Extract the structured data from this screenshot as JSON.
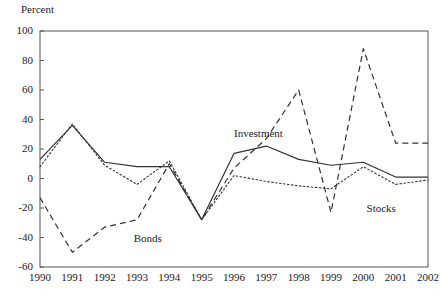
{
  "chart_data": {
    "type": "line",
    "title": "",
    "subtitle": "",
    "xlabel": "",
    "ylabel": "Percent",
    "categories": [
      "1990",
      "1991",
      "1992",
      "1993",
      "1994",
      "1995",
      "1996",
      "1997",
      "1998",
      "1999",
      "2000",
      "2001",
      "2002"
    ],
    "x": [
      1990,
      1991,
      1992,
      1993,
      1994,
      1995,
      1996,
      1997,
      1998,
      1999,
      2000,
      2001,
      2002
    ],
    "xlim": [
      1990,
      2002
    ],
    "ylim": [
      -60,
      100
    ],
    "yticks": [
      -60,
      -40,
      -20,
      0,
      20,
      40,
      60,
      80,
      100
    ],
    "ytick_labels": [
      "-60",
      "-40",
      "-20",
      "0",
      "20",
      "40",
      "60",
      "80",
      "100"
    ],
    "grid": false,
    "legend_position": "inline-annotations",
    "series": [
      {
        "name": "Investment",
        "style": "solid",
        "color": "#333333",
        "values": [
          13,
          36,
          11,
          8,
          8,
          -28,
          17,
          22,
          13,
          9,
          11,
          1,
          1
        ]
      },
      {
        "name": "Bonds",
        "style": "dashed",
        "color": "#333333",
        "values": [
          -13,
          -50,
          -33,
          -28,
          10,
          -28,
          7,
          27,
          60,
          -23,
          88,
          24,
          24
        ]
      },
      {
        "name": "Stocks",
        "style": "dotted",
        "color": "#333333",
        "values": [
          8,
          37,
          9,
          -4,
          12,
          -28,
          2,
          -2,
          -5,
          -7,
          8,
          -4,
          -1
        ]
      }
    ],
    "annotations": [
      {
        "text": "Investment",
        "x": 1996.0,
        "y": 30
      },
      {
        "text": "Bonds",
        "x": 1992.9,
        "y": -41
      },
      {
        "text": "Stocks",
        "x": 2000.1,
        "y": -21
      }
    ]
  },
  "axis": {
    "y_title": "Percent"
  }
}
